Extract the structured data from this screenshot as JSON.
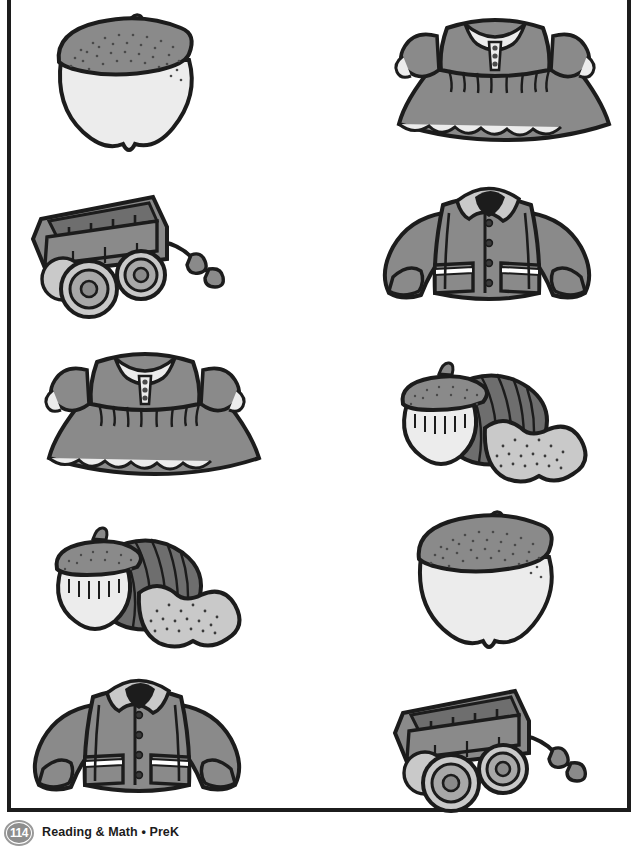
{
  "worksheet": {
    "page_border_color": "#1c1c1c",
    "background_color": "#ffffff",
    "rows": [
      {
        "left": {
          "name": "acorn",
          "label": "acorn"
        },
        "right": {
          "name": "dress",
          "label": "dress"
        }
      },
      {
        "left": {
          "name": "wagon",
          "label": "wagon"
        },
        "right": {
          "name": "coat",
          "label": "coat"
        }
      },
      {
        "left": {
          "name": "dress",
          "label": "dress"
        },
        "right": {
          "name": "nuts",
          "label": "nuts"
        }
      },
      {
        "left": {
          "name": "nuts",
          "label": "nuts"
        },
        "right": {
          "name": "acorn",
          "label": "acorn"
        }
      },
      {
        "left": {
          "name": "coat",
          "label": "coat"
        },
        "right": {
          "name": "wagon",
          "label": "wagon"
        }
      }
    ]
  },
  "footer": {
    "page_number": "114",
    "text": "Reading & Math • PreK",
    "badge_color": "#8e8e8e",
    "text_color": "#1c1c1c"
  },
  "palette": {
    "outline": "#1c1c1c",
    "mid_gray": "#8a8a8a",
    "dark_gray": "#6e6e6e",
    "light_gray": "#c9c9c9",
    "pale": "#ececec",
    "white": "#ffffff"
  }
}
